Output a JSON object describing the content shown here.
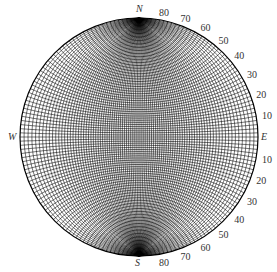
{
  "diagram": {
    "type": "stereonet",
    "directions": {
      "north": "N",
      "south": "S",
      "east": "E",
      "west": "W"
    },
    "right_labels": [
      "80",
      "70",
      "60",
      "50",
      "40",
      "30",
      "20",
      "10",
      "10",
      "20",
      "30",
      "40",
      "50",
      "60",
      "70",
      "80"
    ],
    "colors": {
      "lines": "#000000",
      "labels": "#333333",
      "background": "#ffffff"
    }
  }
}
